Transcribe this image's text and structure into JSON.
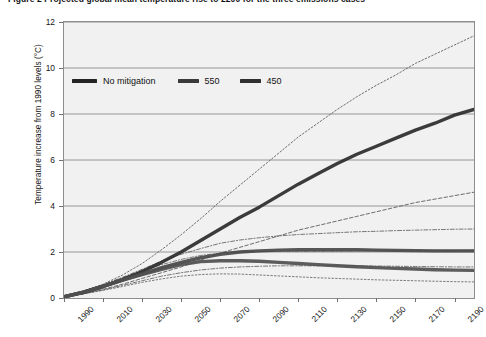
{
  "caption": {
    "text": "Figure 2   Projected global mean temperature rise to 2200 for the three emissions cases"
  },
  "chart_data": {
    "type": "line",
    "title": "",
    "xlabel": "",
    "ylabel": "Temperature increase from 1990 levels (°C)",
    "xlim": [
      1990,
      2200
    ],
    "ylim": [
      0,
      12
    ],
    "yticks": [
      0,
      2,
      4,
      6,
      8,
      10,
      12
    ],
    "xticks": [
      1990,
      2010,
      2030,
      2050,
      2070,
      2090,
      2110,
      2130,
      2150,
      2170,
      2190
    ],
    "grid": "horizontal",
    "legend_position": "upper-left-inside",
    "background": "#f1f1f1",
    "x": [
      1990,
      2000,
      2010,
      2020,
      2030,
      2040,
      2050,
      2060,
      2070,
      2080,
      2090,
      2100,
      2110,
      2120,
      2130,
      2140,
      2150,
      2160,
      2170,
      2180,
      2190,
      2200
    ],
    "series": [
      {
        "name": "No mitigation",
        "style": "thick-solid",
        "color": "#2b2b2b",
        "values": [
          0.05,
          0.25,
          0.5,
          0.8,
          1.15,
          1.55,
          2.0,
          2.5,
          3.0,
          3.5,
          3.95,
          4.45,
          4.95,
          5.4,
          5.85,
          6.25,
          6.6,
          6.95,
          7.3,
          7.6,
          7.95,
          8.2
        ]
      },
      {
        "name": "No mitigation upper bound",
        "style": "dotted",
        "color": "#555555",
        "values": [
          0.05,
          0.3,
          0.6,
          1.0,
          1.5,
          2.1,
          2.75,
          3.45,
          4.2,
          4.9,
          5.6,
          6.3,
          7.0,
          7.6,
          8.2,
          8.75,
          9.25,
          9.7,
          10.2,
          10.6,
          11.0,
          11.4
        ]
      },
      {
        "name": "No mitigation lower bound",
        "style": "dashed",
        "color": "#555555",
        "values": [
          0.05,
          0.2,
          0.38,
          0.6,
          0.85,
          1.1,
          1.35,
          1.65,
          1.95,
          2.2,
          2.45,
          2.7,
          2.95,
          3.15,
          3.35,
          3.55,
          3.75,
          3.95,
          4.15,
          4.3,
          4.45,
          4.6
        ]
      },
      {
        "name": "550",
        "style": "thick-solid",
        "color": "#494949",
        "values": [
          0.05,
          0.25,
          0.5,
          0.78,
          1.05,
          1.32,
          1.55,
          1.75,
          1.9,
          2.0,
          2.05,
          2.08,
          2.1,
          2.1,
          2.1,
          2.1,
          2.08,
          2.07,
          2.06,
          2.05,
          2.05,
          2.05
        ]
      },
      {
        "name": "550 upper bound",
        "style": "dash-dot",
        "color": "#606060",
        "values": [
          0.05,
          0.3,
          0.58,
          0.9,
          1.25,
          1.6,
          1.9,
          2.15,
          2.38,
          2.52,
          2.62,
          2.7,
          2.76,
          2.8,
          2.84,
          2.88,
          2.9,
          2.93,
          2.95,
          2.97,
          2.99,
          3.0
        ]
      },
      {
        "name": "550 lower bound",
        "style": "dash-dot",
        "color": "#606060",
        "values": [
          0.05,
          0.18,
          0.35,
          0.55,
          0.75,
          0.95,
          1.1,
          1.22,
          1.3,
          1.35,
          1.38,
          1.4,
          1.4,
          1.4,
          1.4,
          1.4,
          1.39,
          1.38,
          1.37,
          1.36,
          1.35,
          1.35
        ]
      },
      {
        "name": "450",
        "style": "thick-solid",
        "color": "#4f4f4f",
        "values": [
          0.05,
          0.25,
          0.5,
          0.78,
          1.02,
          1.25,
          1.45,
          1.58,
          1.62,
          1.62,
          1.6,
          1.55,
          1.5,
          1.45,
          1.4,
          1.36,
          1.32,
          1.29,
          1.26,
          1.23,
          1.21,
          1.2
        ]
      },
      {
        "name": "450 upper bound",
        "style": "dash-dot",
        "color": "#666666",
        "values": [
          0.05,
          0.3,
          0.58,
          0.88,
          1.18,
          1.45,
          1.68,
          1.85,
          1.95,
          2.0,
          2.02,
          2.03,
          2.03,
          2.04,
          2.04,
          2.05,
          2.05,
          2.06,
          2.06,
          2.07,
          2.07,
          2.08
        ]
      },
      {
        "name": "450 lower bound",
        "style": "dotted",
        "color": "#666666",
        "values": [
          0.05,
          0.18,
          0.33,
          0.5,
          0.68,
          0.83,
          0.95,
          1.02,
          1.05,
          1.04,
          1.0,
          0.96,
          0.92,
          0.88,
          0.85,
          0.82,
          0.79,
          0.77,
          0.75,
          0.73,
          0.71,
          0.7
        ]
      }
    ]
  },
  "legend": {
    "entries": [
      {
        "label": "No mitigation"
      },
      {
        "label": "550"
      },
      {
        "label": "450"
      }
    ]
  }
}
